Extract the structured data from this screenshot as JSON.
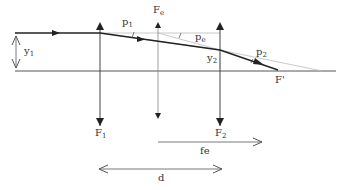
{
  "diagram": {
    "type": "optics-ray-diagram",
    "labels": {
      "y1": "y",
      "y1_sub": "1",
      "p1": "p",
      "p1_sub": "1",
      "fe": "F",
      "fe_sub": "e",
      "pe": "p",
      "pe_sub": "e",
      "y2": "y",
      "y2_sub": "2",
      "p2": "p",
      "p2_sub": "2",
      "fprime": "F'",
      "f1": "F",
      "f1_sub": "1",
      "f2": "F",
      "f2_sub": "2",
      "fe_distance": "fe",
      "d_distance": "d"
    },
    "colors": {
      "ray": "#222222",
      "axis": "#555555",
      "construction": "#aaaaaa"
    }
  }
}
